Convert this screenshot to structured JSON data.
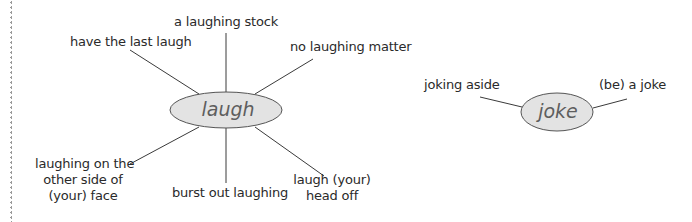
{
  "diagram": {
    "type": "word-map",
    "colors": {
      "line": "#3a3a3a",
      "node_fill": "#e3e3e3",
      "node_stroke": "#555555",
      "node_text": "#5e5e5e",
      "label_text": "#2a2a2a"
    },
    "maps": [
      {
        "center": "laugh",
        "branches": [
          {
            "label": "a laughing stock",
            "position": "top"
          },
          {
            "label": "have the last laugh",
            "position": "top-left"
          },
          {
            "label": "no laughing matter",
            "position": "top-right"
          },
          {
            "label": "laughing on the other side of (your) face",
            "lines": [
              "laughing on the",
              "other side of",
              "(your) face"
            ],
            "position": "bottom-left"
          },
          {
            "label": "burst out laughing",
            "position": "bottom"
          },
          {
            "label": "laugh (your) head off",
            "lines": [
              "laugh (your)",
              "head off"
            ],
            "position": "bottom-right"
          }
        ]
      },
      {
        "center": "joke",
        "branches": [
          {
            "label": "joking aside",
            "position": "left"
          },
          {
            "label": "(be) a joke",
            "position": "right"
          }
        ]
      }
    ]
  }
}
